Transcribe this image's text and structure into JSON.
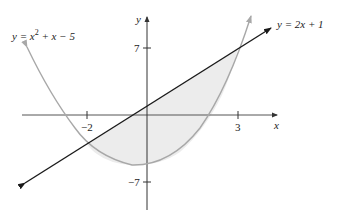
{
  "diagram": {
    "type": "graph-region-between-curves",
    "axes": {
      "x_label": "x",
      "y_label": "y"
    },
    "ticks": {
      "x": [
        "−2",
        "3"
      ],
      "y": [
        "7",
        "−7"
      ]
    },
    "curves": [
      {
        "name": "parabola",
        "label": "y = x² + x − 5",
        "label_main": "y = x",
        "label_sup": "2",
        "label_rest": " + x − 5",
        "color": "#a8a8a8"
      },
      {
        "name": "line",
        "label": "y = 2x + 1",
        "color": "#1a1a1a"
      }
    ],
    "intersections": [
      {
        "x": -2,
        "y": -3
      },
      {
        "x": 3,
        "y": 7
      }
    ],
    "shaded_region": {
      "from_x": -2,
      "to_x": 3,
      "fill": "#ececec"
    }
  }
}
